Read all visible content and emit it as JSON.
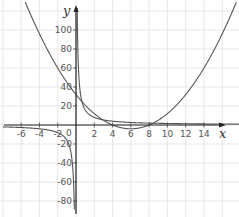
{
  "chart_data": {
    "type": "line",
    "title": "",
    "xlabel": "x",
    "ylabel": "y",
    "xlim": [
      -7.5,
      17.5
    ],
    "ylim": [
      -92,
      130
    ],
    "grid": true,
    "x_ticks": [
      -6,
      -4,
      -2,
      2,
      4,
      6,
      8,
      10,
      12,
      14
    ],
    "x_tick_labels": [
      "-6",
      "-4",
      "-2",
      "2",
      "4",
      "6",
      "8",
      "10",
      "12",
      "14"
    ],
    "y_ticks": [
      100,
      80,
      60,
      40,
      20,
      -20,
      -40,
      -60,
      -80
    ],
    "y_tick_labels": [
      "100",
      "80",
      "60",
      "40",
      "20",
      "-20",
      "-40",
      "-60",
      "-80"
    ],
    "origin_label": "0",
    "series": [
      {
        "name": "parabola",
        "formula": "y = x^2 - 12x + 32",
        "points": [
          [
            -5,
            117
          ],
          [
            -4,
            96
          ],
          [
            -3,
            77
          ],
          [
            -2,
            60
          ],
          [
            -1,
            45
          ],
          [
            0,
            32
          ],
          [
            1,
            21
          ],
          [
            2,
            12
          ],
          [
            3,
            5
          ],
          [
            4,
            0
          ],
          [
            5,
            -3
          ],
          [
            6,
            -4
          ],
          [
            7,
            -3
          ],
          [
            8,
            0
          ],
          [
            9,
            5
          ],
          [
            10,
            12
          ],
          [
            11,
            21
          ],
          [
            12,
            32
          ],
          [
            13,
            45
          ],
          [
            14,
            60
          ],
          [
            15,
            77
          ],
          [
            16,
            96
          ],
          [
            17,
            117
          ]
        ]
      },
      {
        "name": "hyperbola",
        "formula": "y = 16/x",
        "points": [
          [
            -7,
            -2.3
          ],
          [
            -6,
            -2.7
          ],
          [
            -4,
            -4
          ],
          [
            -2,
            -8
          ],
          [
            -1,
            -16
          ],
          [
            -0.5,
            -32
          ],
          [
            -0.2,
            -80
          ],
          [
            0.15,
            107
          ],
          [
            0.5,
            32
          ],
          [
            1,
            16
          ],
          [
            2,
            8
          ],
          [
            4,
            4
          ],
          [
            8,
            2
          ],
          [
            12,
            1.3
          ],
          [
            16,
            1
          ]
        ]
      }
    ]
  }
}
